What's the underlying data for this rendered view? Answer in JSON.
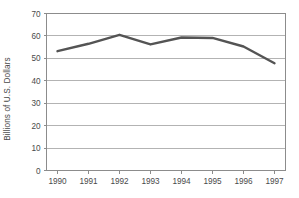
{
  "chart_data": {
    "type": "line",
    "title": "",
    "xlabel": "",
    "ylabel": "Billions of U.S. Dollars",
    "categories": [
      "1990",
      "1991",
      "1992",
      "1993",
      "1994",
      "1995",
      "1996",
      "1997"
    ],
    "values": [
      53.2,
      56.5,
      60.5,
      56.2,
      59.3,
      59.1,
      55.3,
      47.8
    ],
    "series": [
      {
        "name": "Billions of U.S. Dollars",
        "values": [
          53.2,
          56.5,
          60.5,
          56.2,
          59.3,
          59.1,
          55.3,
          47.8
        ]
      }
    ],
    "ylim": [
      0,
      70
    ],
    "yticks": [
      0,
      10,
      20,
      30,
      40,
      50,
      60,
      70
    ],
    "ytick_labels": [
      "0",
      "10",
      "20",
      "30",
      "40",
      "50",
      "60",
      "70"
    ],
    "xtick_labels": [
      "1990",
      "1991",
      "1992",
      "1993",
      "1994",
      "1995",
      "1996",
      "1997"
    ],
    "grid": "horizontal",
    "legend": "none",
    "line_color": "#545454",
    "grid_color": "#b3b3b3",
    "axis_color": "#8c8c8c",
    "background": "#ffffff"
  }
}
